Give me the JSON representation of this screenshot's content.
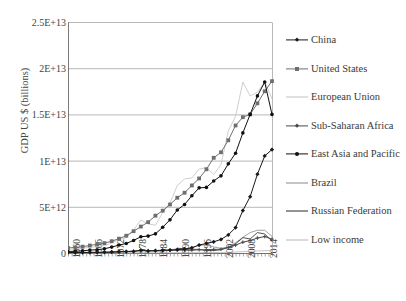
{
  "cropped_title": "",
  "chart_data": {
    "type": "line",
    "title": "",
    "xlabel": "",
    "ylabel": "GDP US $ (billions)",
    "grid": "horizontal",
    "legend_position": "right",
    "ylim": [
      0,
      25000000000000
    ],
    "ytick_labels": [
      "0",
      "5E+12",
      "1E+13",
      "1.5E+13",
      "2E+13",
      "2.5E+13"
    ],
    "ytick_values": [
      0,
      5000000000000,
      10000000000000,
      15000000000000,
      20000000000000,
      25000000000000
    ],
    "xlim": [
      1960,
      2016
    ],
    "xtick_labels": [
      "1960",
      "1966",
      "1972",
      "1978",
      "1984",
      "1990",
      "1996",
      "2002",
      "2008",
      "2014"
    ],
    "xtick_values": [
      1960,
      1966,
      1972,
      1978,
      1984,
      1990,
      1996,
      2002,
      2008,
      2014
    ],
    "x": [
      1960,
      1962,
      1964,
      1966,
      1968,
      1970,
      1972,
      1974,
      1976,
      1978,
      1980,
      1982,
      1984,
      1986,
      1988,
      1990,
      1992,
      1994,
      1996,
      1998,
      2000,
      2002,
      2004,
      2006,
      2008,
      2010,
      2012,
      2014,
      2016
    ],
    "series": [
      {
        "name": "China",
        "color": "#1a1a1a",
        "marker": "diamond",
        "values": [
          59700000000.0,
          47100000000.0,
          59700000000.0,
          76500000000.0,
          70700000000.0,
          92500000000.0,
          113000000000.0,
          144000000000.0,
          152000000000.0,
          150000000000.0,
          306000000000.0,
          205000000000.0,
          259000000000.0,
          301000000000.0,
          312000000000.0,
          361000000000.0,
          427000000000.0,
          564000000000.0,
          864000000000.0,
          1030000000000.0,
          1210000000000.0,
          1470000000000.0,
          1960000000000.0,
          2750000000000.0,
          4590000000000.0,
          6090000000000.0,
          8530000000000.0,
          10500000000000.0,
          11200000000000.0
        ]
      },
      {
        "name": "United States",
        "color": "#6e6e6e",
        "marker": "square",
        "values": [
          543000000000.0,
          605000000000.0,
          686000000000.0,
          815000000000.0,
          940000000000.0,
          1070000000000.0,
          1280000000000.0,
          1550000000000.0,
          1870000000000.0,
          2360000000000.0,
          2860000000000.0,
          3340000000000.0,
          4040000000000.0,
          4580000000000.0,
          5250000000000.0,
          5980000000000.0,
          6520000000000.0,
          7310000000000.0,
          8070000000000.0,
          9060000000000.0,
          10300000000000.0,
          10900000000000.0,
          12200000000000.0,
          13800000000000.0,
          14700000000000.0,
          15000000000000.0,
          16200000000000.0,
          17500000000000.0,
          18600000000000.0
        ]
      },
      {
        "name": "European Union",
        "color": "#c2c2c2",
        "marker": "none",
        "values": [
          368000000000.0,
          437000000000.0,
          522000000000.0,
          624000000000.0,
          684000000000.0,
          802000000000.0,
          1080000000000.0,
          1450000000000.0,
          1650000000000.0,
          2480000000000.0,
          3570000000000.0,
          3160000000000.0,
          3000000000000.0,
          4380000000000.0,
          5420000000000.0,
          7300000000000.0,
          8010000000000.0,
          8120000000000.0,
          9080000000000.0,
          9250000000000.0,
          8500000000000.0,
          9570000000000.0,
          13200000000000.0,
          14800000000000.0,
          18500000000000.0,
          17000000000000.0,
          17400000000000.0,
          18500000000000.0,
          16700000000000.0
        ]
      },
      {
        "name": "Sub-Saharan Africa",
        "color": "#4a4a4a",
        "marker": "cross",
        "values": [
          30000000000.0,
          34000000000.0,
          40000000000.0,
          48000000000.0,
          54000000000.0,
          66000000000.0,
          84000000000.0,
          124000000000.0,
          155000000000.0,
          203000000000.0,
          284000000000.0,
          262000000000.0,
          240000000000.0,
          245000000000.0,
          290000000000.0,
          310000000000.0,
          315000000000.0,
          305000000000.0,
          355000000000.0,
          330000000000.0,
          390000000000.0,
          410000000000.0,
          600000000000.0,
          850000000000.0,
          1170000000000.0,
          1350000000000.0,
          1620000000000.0,
          1780000000000.0,
          1500000000000.0
        ]
      },
      {
        "name": "East Asia and Pacific",
        "color": "#111111",
        "marker": "dot",
        "values": [
          165000000000.0,
          188000000000.0,
          235000000000.0,
          320000000000.0,
          355000000000.0,
          460000000000.0,
          640000000000.0,
          860000000000.0,
          1030000000000.0,
          1360000000000.0,
          1760000000000.0,
          1830000000000.0,
          2070000000000.0,
          2790000000000.0,
          3590000000000.0,
          4660000000000.0,
          5250000000000.0,
          6200000000000.0,
          7050000000000.0,
          7100000000000.0,
          7800000000000.0,
          8350000000000.0,
          9650000000000.0,
          10800000000000.0,
          13000000000000.0,
          15000000000000.0,
          17000000000000.0,
          18500000000000.0,
          15000000000000.0
        ]
      },
      {
        "name": "Brazil",
        "color": "#8a8a8a",
        "marker": "none",
        "values": [
          15000000000.0,
          20000000000.0,
          22000000000.0,
          30000000000.0,
          34000000000.0,
          42000000000.0,
          59000000000.0,
          106000000000.0,
          154000000000.0,
          201000000000.0,
          236000000000.0,
          272000000000.0,
          208000000000.0,
          268000000000.0,
          330000000000.0,
          462000000000.0,
          390000000000.0,
          559000000000.0,
          851000000000.0,
          864000000000.0,
          655000000000.0,
          508000000000.0,
          664000000000.0,
          1110000000000.0,
          1700000000000.0,
          2210000000000.0,
          2460000000000.0,
          2460000000000.0,
          1800000000000.0
        ]
      },
      {
        "name": "Russian Federation",
        "color": "#2b2b2b",
        "marker": "none",
        "values": [
          0,
          0,
          0,
          0,
          0,
          0,
          0,
          0,
          0,
          0,
          0,
          0,
          0,
          0,
          0,
          516000000000.0,
          460000000000.0,
          395000000000.0,
          392000000000.0,
          271000000000.0,
          260000000000.0,
          345000000000.0,
          591000000000.0,
          990000000000.0,
          1660000000000.0,
          1520000000000.0,
          2210000000000.0,
          2060000000000.0,
          1280000000000.0
        ]
      },
      {
        "name": "Low income",
        "color": "#b5b5b5",
        "marker": "none",
        "values": [
          2000000000.0,
          2400000000.0,
          2800000000.0,
          3400000000.0,
          3800000000.0,
          4600000000.0,
          5800000000.0,
          8400000000.0,
          10000000000.0,
          13000000000.0,
          18000000000.0,
          19000000000.0,
          20000000000.0,
          22000000000.0,
          26000000000.0,
          30000000000.0,
          32000000000.0,
          34000000000.0,
          40000000000.0,
          42000000000.0,
          46000000000.0,
          54000000000.0,
          74000000000.0,
          102000000000.0,
          148000000000.0,
          180000000000.0,
          222000000000.0,
          260000000000.0,
          270000000000.0
        ]
      }
    ]
  },
  "legend": {
    "items": [
      {
        "label": "China"
      },
      {
        "label": "United States"
      },
      {
        "label": "European Union"
      },
      {
        "label": "Sub-Saharan Africa"
      },
      {
        "label": "East Asia and Pacific"
      },
      {
        "label": "Brazil"
      },
      {
        "label": "Russian Federation"
      },
      {
        "label": "Low income"
      }
    ]
  }
}
